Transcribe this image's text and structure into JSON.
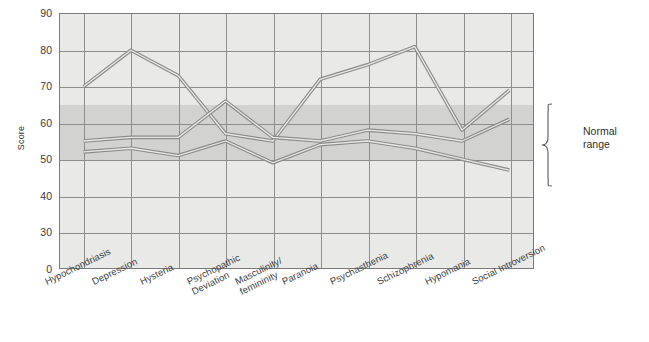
{
  "chart_data": {
    "type": "line",
    "title": "",
    "subtitle": "",
    "xlabel": "",
    "ylabel": "Score",
    "categories": [
      "Hypochondriasis",
      "Depression",
      "Hysteria",
      "Psychopathic\nDeviation",
      "Masculinity/\nfemininity",
      "Paranoia",
      "Psychasthenia",
      "Schizophrenia",
      "Hypomania",
      "Social Introversion"
    ],
    "y_tick_labels": [
      "90",
      "80",
      "70",
      "60",
      "50",
      "40",
      "30",
      "0"
    ],
    "y_tick_values": [
      90,
      80,
      70,
      60,
      50,
      40,
      30,
      0
    ],
    "ylim": [
      30,
      90
    ],
    "axis_break": true,
    "axis_break_note": "Scale break between 30 and 0",
    "grid": true,
    "legend": "none",
    "series": [
      {
        "name": "profile-1",
        "values": [
          70,
          80,
          73,
          57,
          55,
          72,
          76,
          81,
          58,
          69
        ]
      },
      {
        "name": "profile-2",
        "values": [
          55,
          56,
          56,
          66,
          56,
          55,
          58,
          57,
          55,
          61
        ]
      },
      {
        "name": "profile-3",
        "values": [
          52,
          53,
          51,
          55,
          49,
          54,
          55,
          53,
          50,
          47
        ]
      }
    ],
    "bands": [
      {
        "name": "normal-range",
        "label": "Normal\nrange",
        "y0": 50,
        "y1": 65,
        "color": "#d2d2d0"
      }
    ],
    "annotations": [
      {
        "name": "normal-range-label",
        "text": "Normal\nrange",
        "position": "right-outside"
      }
    ],
    "colors": {
      "plot_background": "#e9e9e7",
      "band": "#d2d2d0",
      "grid": "#8d8d8d",
      "axis": "#7a7a7a",
      "series_stroke": "#8a8a8a",
      "series_core": "#e9e9e7",
      "text": "#333333"
    }
  },
  "axis": {
    "y_title": "Score"
  },
  "annotation": {
    "normal_range_text": "Normal\nrange"
  }
}
